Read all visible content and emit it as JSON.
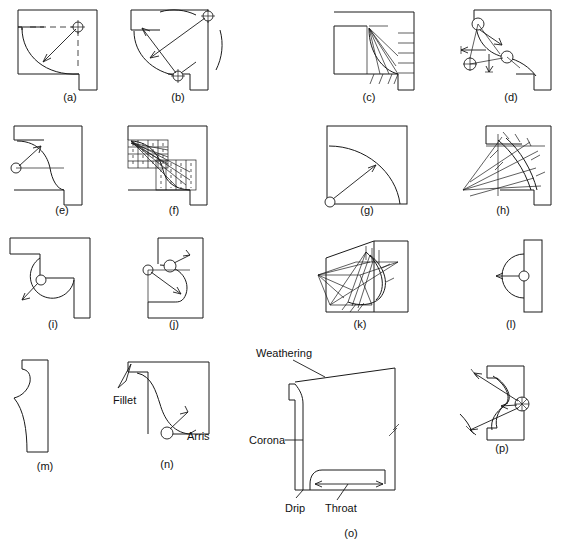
{
  "figure": {
    "panel_count": 16,
    "captions": [
      {
        "key": "a",
        "text": "(a)",
        "x": 70,
        "y": 101
      },
      {
        "key": "b",
        "text": "(b)",
        "x": 178,
        "y": 101
      },
      {
        "key": "c",
        "text": "(c)",
        "x": 369,
        "y": 101
      },
      {
        "key": "d",
        "text": "(d)",
        "x": 511,
        "y": 101
      },
      {
        "key": "e",
        "text": "(e)",
        "x": 62,
        "y": 214
      },
      {
        "key": "f",
        "text": "(f)",
        "x": 174,
        "y": 214
      },
      {
        "key": "g",
        "text": "(g)",
        "x": 367,
        "y": 214
      },
      {
        "key": "h",
        "text": "(h)",
        "x": 503,
        "y": 214
      },
      {
        "key": "i",
        "text": "(i)",
        "x": 53,
        "y": 328
      },
      {
        "key": "j",
        "text": "(j)",
        "x": 174,
        "y": 328
      },
      {
        "key": "k",
        "text": "(k)",
        "x": 360,
        "y": 328
      },
      {
        "key": "l",
        "text": "(l)",
        "x": 511,
        "y": 328
      },
      {
        "key": "m",
        "text": "(m)",
        "x": 45,
        "y": 470
      },
      {
        "key": "n",
        "text": "(n)",
        "x": 167,
        "y": 468
      },
      {
        "key": "o",
        "text": "(o)",
        "x": 351,
        "y": 537
      },
      {
        "key": "p",
        "text": "(p)",
        "x": 502,
        "y": 452
      }
    ],
    "annotations": [
      {
        "key": "weathering",
        "text": "Weathering",
        "x": 256,
        "y": 357
      },
      {
        "key": "corona",
        "text": "Corona",
        "x": 249,
        "y": 440
      },
      {
        "key": "drip",
        "text": "Drip",
        "x": 285,
        "y": 512
      },
      {
        "key": "throat",
        "text": "Throat",
        "x": 325,
        "y": 512
      },
      {
        "key": "fillet",
        "text": "Fillet",
        "x": 113,
        "y": 404
      },
      {
        "key": "arris",
        "text": "Arris",
        "x": 187,
        "y": 440
      }
    ],
    "colors": {
      "ink": "#1a1a1a",
      "background": "#ffffff",
      "center_fill": "#ffffff"
    }
  }
}
